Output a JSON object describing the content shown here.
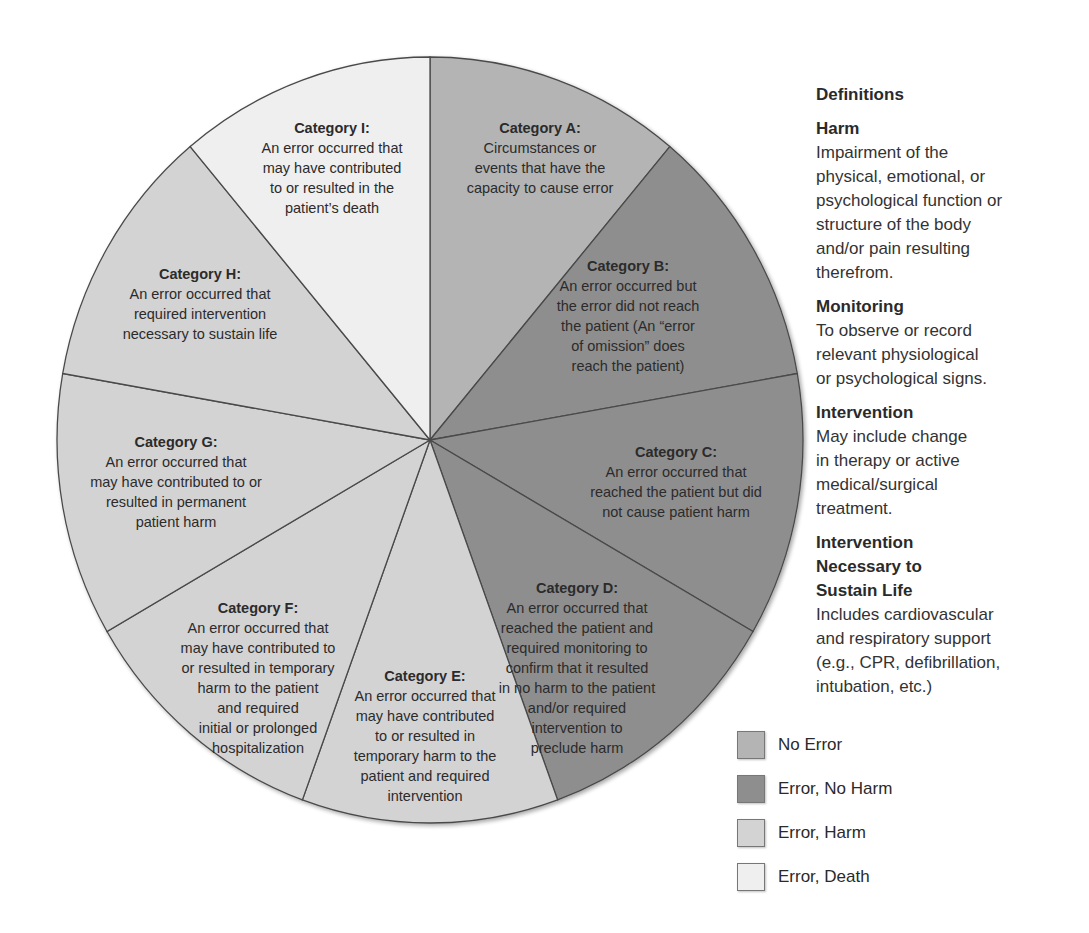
{
  "chart_data": {
    "type": "pie",
    "title": "",
    "equal_slices": true,
    "slice_angle_deg": 40,
    "slices": [
      {
        "id": "A",
        "title": "Category A:",
        "text": "Circumstances or\nevents that have the\ncapacity to cause error",
        "group": "No Error",
        "value": 1
      },
      {
        "id": "B",
        "title": "Category B:",
        "text": "An error occurred but\nthe error did not reach\nthe patient (An “error\nof omission” does\nreach the patient)",
        "group": "Error, No Harm",
        "value": 1
      },
      {
        "id": "C",
        "title": "Category C:",
        "text": "An error occurred that\nreached the patient but did\nnot cause patient harm",
        "group": "Error, No Harm",
        "value": 1
      },
      {
        "id": "D",
        "title": "Category D:",
        "text": "An error occurred that\nreached the patient and\nrequired monitoring to\nconfirm that it resulted\nin no harm to the patient\nand/or required\nintervention to\npreclude harm",
        "group": "Error, No Harm",
        "value": 1
      },
      {
        "id": "E",
        "title": "Category E:",
        "text": "An error occurred that\nmay have contributed\nto or resulted in\ntemporary harm to the\npatient and required\nintervention",
        "group": "Error, Harm",
        "value": 1
      },
      {
        "id": "F",
        "title": "Category F:",
        "text": "An error occurred that\nmay have contributed to\nor resulted in temporary\nharm to the patient\nand required\ninitial or prolonged\nhospitalization",
        "group": "Error, Harm",
        "value": 1
      },
      {
        "id": "G",
        "title": "Category G:",
        "text": "An error occurred that\nmay have contributed to or\nresulted in permanent\npatient harm",
        "group": "Error, Harm",
        "value": 1
      },
      {
        "id": "H",
        "title": "Category H:",
        "text": "An error occurred that\nrequired intervention\nnecessary to sustain life",
        "group": "Error, Harm",
        "value": 1
      },
      {
        "id": "I",
        "title": "Category I:",
        "text": "An error occurred that\nmay have contributed\nto or resulted in the\npatient’s death",
        "group": "Error, Death",
        "value": 1
      }
    ],
    "legend": [
      {
        "label": "No Error",
        "color": "#b4b4b4"
      },
      {
        "label": "Error, No Harm",
        "color": "#8e8e8e"
      },
      {
        "label": "Error, Harm",
        "color": "#d3d3d3"
      },
      {
        "label": "Error, Death",
        "color": "#efefef"
      }
    ],
    "legend_position": "bottom-right"
  },
  "definitions": {
    "heading": "Definitions",
    "items": [
      {
        "term": "Harm",
        "description": "Impairment of the\nphysical, emotional, or\npsychological function or\nstructure of the body\nand/or pain resulting\ntherefrom."
      },
      {
        "term": "Monitoring",
        "description": "To observe or record\nrelevant physiological\nor psychological signs."
      },
      {
        "term": "Intervention",
        "description": "May include change\nin therapy or active\nmedical/surgical\ntreatment."
      },
      {
        "term": "Intervention\nNecessary to\nSustain Life",
        "description": "Includes cardiovascular\nand respiratory support\n(e.g., CPR, defibrillation,\nintubation, etc.)"
      }
    ]
  }
}
